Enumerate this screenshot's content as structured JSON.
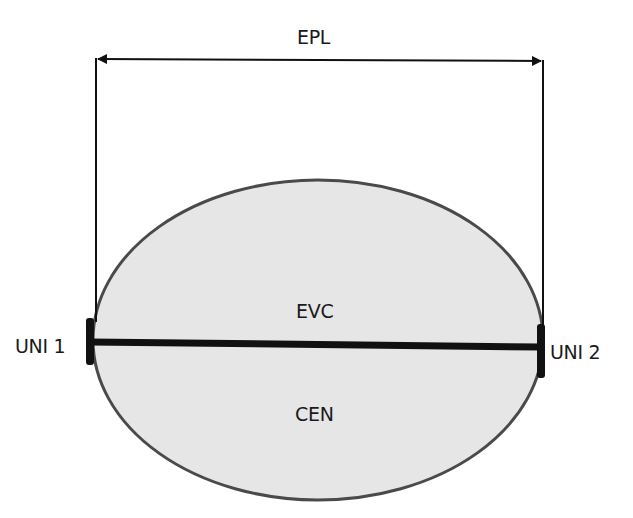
{
  "diagram": {
    "type": "network-service-illustration",
    "measurement": {
      "label": "EPL"
    },
    "cloud": {
      "upper_label": "EVC",
      "lower_label": "CEN",
      "fill": "#e6e6e6",
      "stroke": "#4a4a4a"
    },
    "endpoints": [
      {
        "id": "uni1",
        "label": "UNI 1",
        "side": "left"
      },
      {
        "id": "uni2",
        "label": "UNI 2",
        "side": "right"
      }
    ],
    "connection": {
      "from": "UNI 1",
      "to": "UNI 2",
      "label": "EVC"
    },
    "colors": {
      "line": "#111111",
      "background": "#ffffff"
    }
  }
}
